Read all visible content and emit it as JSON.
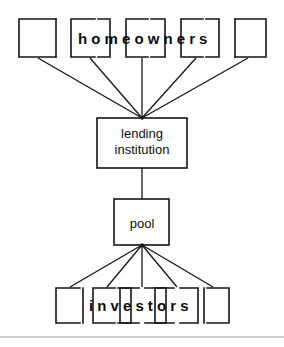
{
  "figure": {
    "title_text": "",
    "background_color": "#ffffff",
    "stroke_color": "#151515",
    "rule_color": "#9a9a9a",
    "width": 284,
    "height": 347
  },
  "tiers": {
    "top": {
      "label": "homeowners",
      "group_name": "homeowners-group",
      "box_count": 5
    },
    "bottom": {
      "label": "investors",
      "group_name": "investors-group",
      "box_count": 5
    }
  },
  "nodes": {
    "lending": {
      "line1": "lending",
      "line2": "institution"
    },
    "pool": {
      "label": "pool"
    }
  },
  "flows": {
    "homeowners_to_lending": {
      "name": "homeowners-to-lending-flow",
      "edge_count": 5
    },
    "lending_to_pool": {
      "name": "lending-to-pool-flow",
      "edge_count": 1
    },
    "pool_to_investors": {
      "name": "pool-to-investors-flow",
      "edge_count": 5
    }
  },
  "footer": {
    "divider": "horizontal-rule"
  }
}
